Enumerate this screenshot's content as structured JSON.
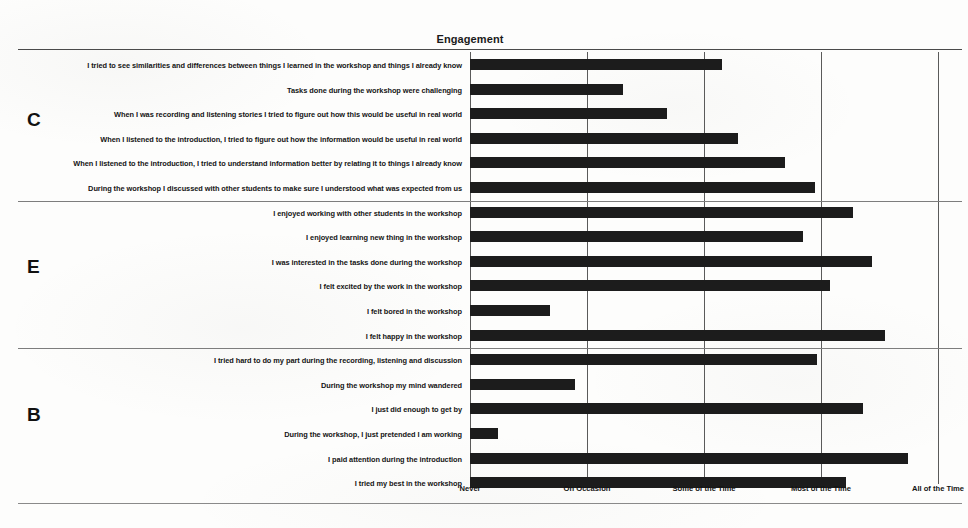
{
  "chart_data": {
    "type": "bar",
    "orientation": "horizontal",
    "title": "Engagement",
    "xlabel": "",
    "ylabel": "",
    "grid": true,
    "legend": false,
    "xticklabels": [
      "Never",
      "On Occasion",
      "Some of the Time",
      "Most of the Time",
      "All of the Time"
    ],
    "xtickvalues": [
      0,
      1,
      2,
      3,
      4
    ],
    "xlim": [
      0,
      4
    ],
    "groups": [
      {
        "letter": "C",
        "categories": [
          "I tried to see similarities and differences between things I learned in the workshop and things I already know",
          "Tasks done during the workshop were challenging",
          "When I was recording and listening stories I tried to figure out how this would be useful in real world",
          "When I listened to the introduction, I tried to figure out how the information would be useful in real world",
          "When I listened to the introduction, I tried to understand information better by relating it to things I already know",
          "During the workshop I discussed with other students to make sure I understood what was expected from us"
        ],
        "values": [
          2.15,
          1.31,
          1.68,
          2.29,
          2.69,
          2.95
        ]
      },
      {
        "letter": "E",
        "categories": [
          "I enjoyed working with other students in the workshop",
          "I enjoyed learning new thing in the workshop",
          "I was interested in the tasks done during the workshop",
          "I felt excited by the work in the workshop",
          "I felt bored in the workshop",
          "I felt happy in the workshop"
        ],
        "values": [
          3.27,
          2.85,
          3.44,
          3.08,
          0.68,
          3.55
        ]
      },
      {
        "letter": "B",
        "categories": [
          "I tried hard to do my part during the recording, listening and discussion",
          "During the workshop my mind wandered",
          "I just did enough to get by",
          "During the workshop, I just pretended I am working",
          "I paid attention during the introduction",
          "I tried my best in the workshop"
        ],
        "values": [
          2.97,
          0.9,
          3.36,
          0.24,
          3.74,
          3.21
        ]
      }
    ],
    "bar_color": "#1c1c1c"
  }
}
